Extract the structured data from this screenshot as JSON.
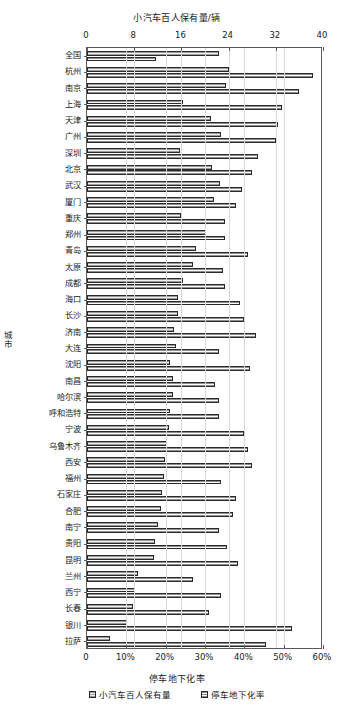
{
  "chart_data": {
    "type": "bar",
    "orientation": "horizontal",
    "title": "",
    "top_axis": {
      "label": "小汽车百人保有量/辆",
      "ticks": [
        "0",
        "8",
        "16",
        "24",
        "32",
        "40"
      ],
      "min": 0,
      "max": 40
    },
    "bottom_axis": {
      "label": "停车地下化率",
      "ticks": [
        "0",
        "10%",
        "20%",
        "30%",
        "40%",
        "50%",
        "60%"
      ],
      "min": 0,
      "max": 60
    },
    "ylabel": "城市",
    "grid": true,
    "legend_position": "bottom",
    "categories": [
      "全国",
      "杭州",
      "南京",
      "上海",
      "天津",
      "广州",
      "深圳",
      "北京",
      "武汉",
      "厦门",
      "重庆",
      "郑州",
      "青岛",
      "太原",
      "成都",
      "海口",
      "长沙",
      "济南",
      "大连",
      "沈阳",
      "南昌",
      "哈尔滨",
      "呼和浩特",
      "宁波",
      "乌鲁木齐",
      "西安",
      "福州",
      "石家庄",
      "合肥",
      "南宁",
      "贵阳",
      "昆明",
      "兰州",
      "西宁",
      "长春",
      "银川",
      "拉萨"
    ],
    "series": [
      {
        "name": "小汽车百人保有量",
        "unit": "辆",
        "axis": "top",
        "values": [
          22.3,
          24.0,
          23.6,
          16.2,
          21.0,
          22.7,
          15.8,
          21.2,
          22.5,
          21.5,
          16.0,
          20.2,
          18.4,
          17.9,
          16.3,
          15.5,
          15.4,
          14.8,
          15.0,
          14.0,
          14.6,
          14.6,
          14.0,
          13.9,
          13.6,
          13.3,
          13.1,
          12.7,
          12.6,
          12.1,
          11.6,
          11.4,
          8.6,
          8.1,
          7.8,
          6.7,
          3.9
        ]
      },
      {
        "name": "停车地下化率",
        "unit": "%",
        "axis": "bottom",
        "values": [
          17.5,
          57.5,
          54.0,
          49.5,
          48.5,
          48.0,
          43.5,
          42.0,
          39.5,
          38.0,
          35.0,
          35.0,
          41.0,
          34.5,
          35.0,
          39.0,
          40.0,
          43.0,
          33.5,
          41.5,
          32.5,
          33.5,
          33.5,
          40.0,
          41.0,
          42.0,
          34.0,
          38.0,
          37.0,
          33.5,
          35.5,
          38.5,
          27.0,
          34.0,
          31.0,
          52.0,
          45.5
        ]
      }
    ]
  }
}
